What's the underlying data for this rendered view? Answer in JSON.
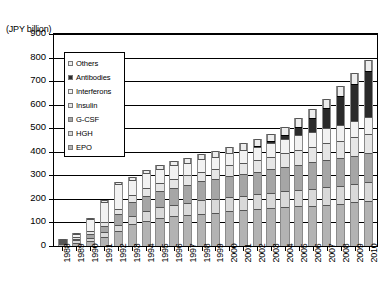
{
  "chart_data": {
    "type": "bar",
    "stacked": true,
    "title": "",
    "xlabel": "",
    "ylabel": "(JPY billion)",
    "ylim": [
      0,
      900
    ],
    "ytick_step": 100,
    "yticks": [
      0,
      100,
      200,
      300,
      400,
      500,
      600,
      700,
      800,
      900
    ],
    "grid": true,
    "legend_position": "upper-left-inside",
    "categories": [
      "1988",
      "1989",
      "1990",
      "1991",
      "1992",
      "1993",
      "1994",
      "1995",
      "1996",
      "1997",
      "1998",
      "1999",
      "2000",
      "2001",
      "2002",
      "2003",
      "2004",
      "2005",
      "2006",
      "2007",
      "2008",
      "2009",
      "2010"
    ],
    "series": [
      {
        "name": "EPO",
        "color": "#b3b3b3",
        "values": [
          8,
          14,
          22,
          40,
          62,
          92,
          108,
          118,
          126,
          132,
          138,
          142,
          148,
          152,
          156,
          160,
          164,
          168,
          172,
          176,
          180,
          186,
          192
        ]
      },
      {
        "name": "HGH",
        "color": "#d9d9d9",
        "values": [
          6,
          10,
          14,
          20,
          28,
          36,
          42,
          46,
          50,
          52,
          56,
          58,
          60,
          62,
          64,
          66,
          68,
          70,
          72,
          74,
          76,
          78,
          80
        ]
      },
      {
        "name": "G-CSF",
        "color": "#a6a6a6",
        "values": [
          2,
          6,
          14,
          26,
          44,
          58,
          64,
          68,
          72,
          76,
          80,
          84,
          88,
          92,
          96,
          100,
          104,
          108,
          112,
          116,
          118,
          120,
          122
        ]
      },
      {
        "name": "Insulin",
        "color": "#e6e6e6",
        "values": [
          4,
          8,
          12,
          18,
          24,
          30,
          34,
          36,
          38,
          40,
          42,
          44,
          46,
          48,
          50,
          54,
          58,
          62,
          66,
          70,
          74,
          78,
          82
        ]
      },
      {
        "name": "Interferons",
        "color": "#f2f2f2",
        "values": [
          4,
          14,
          54,
          84,
          106,
          66,
          62,
          58,
          56,
          54,
          52,
          50,
          52,
          54,
          56,
          58,
          60,
          62,
          64,
          66,
          68,
          70,
          72
        ]
      },
      {
        "name": "Antibodies",
        "color": "#2b2b2b",
        "values": [
          0,
          0,
          0,
          0,
          0,
          0,
          0,
          0,
          0,
          0,
          0,
          0,
          0,
          0,
          2,
          6,
          16,
          36,
          56,
          82,
          120,
          158,
          196
        ]
      },
      {
        "name": "Others",
        "color": "#ededed",
        "values": [
          1,
          2,
          4,
          6,
          8,
          12,
          14,
          16,
          18,
          20,
          22,
          24,
          26,
          28,
          30,
          32,
          34,
          36,
          38,
          40,
          42,
          44,
          46
        ]
      }
    ],
    "totals": [
      25,
      54,
      120,
      194,
      272,
      294,
      324,
      342,
      360,
      374,
      390,
      402,
      420,
      436,
      454,
      476,
      504,
      542,
      580,
      624,
      678,
      734,
      790
    ]
  },
  "legend": {
    "items": [
      {
        "label": "Others",
        "swatch": "#ededed"
      },
      {
        "label": "Antibodies",
        "swatch": "#2b2b2b"
      },
      {
        "label": "Interferons",
        "swatch": "#f2f2f2"
      },
      {
        "label": "Insulin",
        "swatch": "#e6e6e6"
      },
      {
        "label": "G-CSF",
        "swatch": "#a6a6a6"
      },
      {
        "label": "HGH",
        "swatch": "#d9d9d9"
      },
      {
        "label": "EPO",
        "swatch": "#b3b3b3"
      }
    ]
  }
}
